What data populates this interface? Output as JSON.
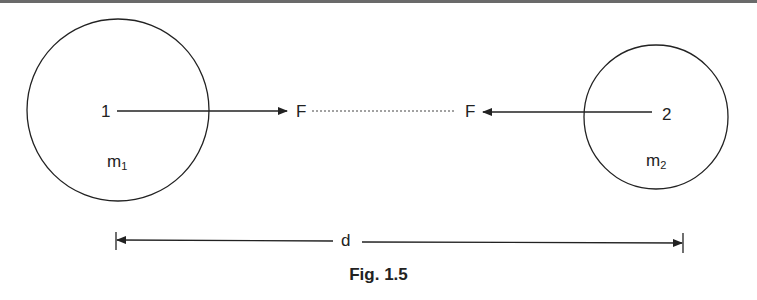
{
  "diagram": {
    "caption": "Fig. 1.5",
    "bodies": [
      {
        "id": "1",
        "point_label": "1",
        "mass_label": "m",
        "mass_subscript": "1"
      },
      {
        "id": "2",
        "point_label": "2",
        "mass_label": "m",
        "mass_subscript": "2"
      }
    ],
    "forces": [
      {
        "label": "F",
        "direction": "toward body 2"
      },
      {
        "label": "F",
        "direction": "toward body 1"
      }
    ],
    "distance_label": "d",
    "colors": {
      "stroke": "#222222",
      "background": "#ffffff"
    }
  }
}
